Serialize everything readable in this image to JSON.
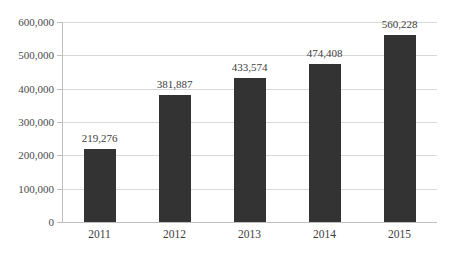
{
  "chart_data": {
    "type": "bar",
    "title": "",
    "subtitle": "",
    "xlabel": "",
    "ylabel": "",
    "categories": [
      "2011",
      "2012",
      "2013",
      "2014",
      "2015"
    ],
    "values": [
      219276,
      381887,
      433574,
      474408,
      560228
    ],
    "data_labels": [
      "219,276",
      "381,887",
      "433,574",
      "474,408",
      "560,228"
    ],
    "ylim": [
      0,
      600000
    ],
    "ytick_values": [
      0,
      100000,
      200000,
      300000,
      400000,
      500000,
      600000
    ],
    "ytick_labels": [
      "0",
      "100,000",
      "200,000",
      "300,000",
      "400,000",
      "500,000",
      "600,000"
    ],
    "grid": true,
    "legend": false,
    "legend_position": "none",
    "series": [
      {
        "name": "",
        "values": [
          219276,
          381887,
          433574,
          474408,
          560228
        ]
      }
    ],
    "colors": {
      "bar": "#333333",
      "gridline": "#d9d9d9",
      "axis": "#bfbfbf",
      "label_text": "#3d3d3d",
      "tick_text": "#4a4a4a",
      "background": "#ffffff"
    }
  }
}
